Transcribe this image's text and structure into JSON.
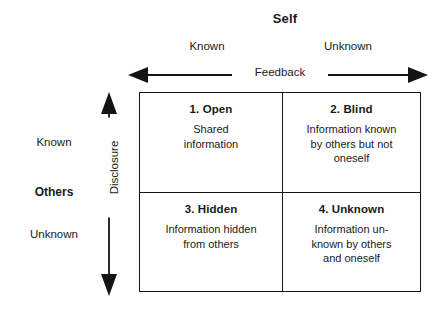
{
  "diagram": {
    "title": "Self",
    "column_axis": {
      "name": "Self",
      "arrow_label": "Feedback",
      "headers": [
        "Known",
        "Unknown"
      ]
    },
    "row_axis": {
      "name": "Others",
      "arrow_label": "Disclosure",
      "headers": [
        "Known",
        "Unknown"
      ]
    },
    "quadrants": [
      {
        "id": "open",
        "title": "1.  Open",
        "body": "Shared\ninformation"
      },
      {
        "id": "blind",
        "title": "2.  Blind",
        "body": "Information known\nby others but not\noneself"
      },
      {
        "id": "hidden",
        "title": "3.  Hidden",
        "body": "Information hidden\nfrom others"
      },
      {
        "id": "unknown",
        "title": "4.  Unknown",
        "body": "Information un-\nknown by others\nand oneself"
      }
    ],
    "colors": {
      "ink": "#141414",
      "background": "#ffffff"
    }
  }
}
